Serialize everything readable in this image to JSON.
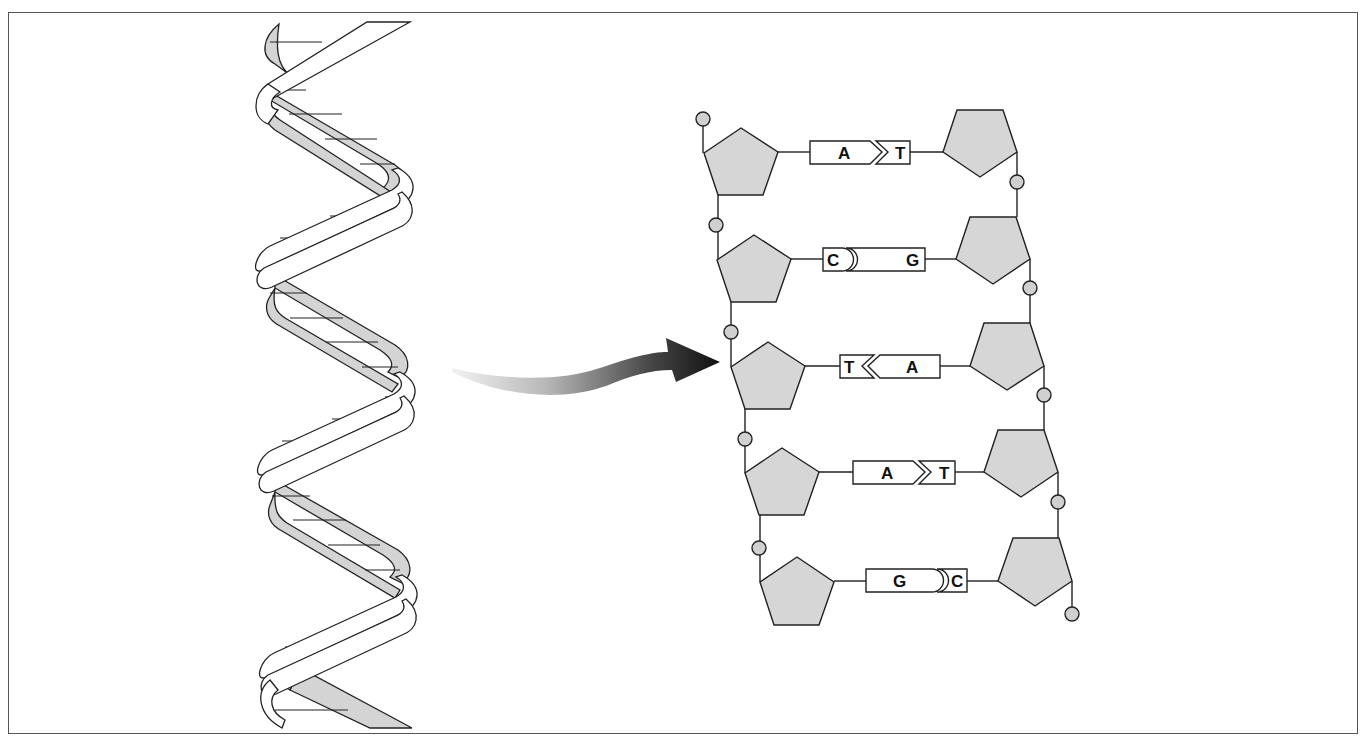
{
  "diagram": {
    "colors": {
      "stroke": "#222222",
      "sugar_fill": "#d6d6d6",
      "phosphate_fill": "#d0d0d0",
      "helix_back_fill": "#d4d4d4",
      "helix_front_fill": "#ffffff",
      "arrow_start": "#e8e8e8",
      "arrow_end": "#111111",
      "background": "#ffffff"
    },
    "helix": {
      "label": "double-helix",
      "turns": 2
    },
    "arrow": {
      "label": "unwinding-arrow"
    },
    "base_pairs": [
      {
        "left": "A",
        "right": "T",
        "left_shape": "arrow",
        "right_shape": "notch"
      },
      {
        "left": "C",
        "right": "G",
        "left_shape": "round",
        "right_shape": "cup"
      },
      {
        "left": "T",
        "right": "A",
        "left_shape": "notch",
        "right_shape": "arrow"
      },
      {
        "left": "A",
        "right": "T",
        "left_shape": "arrow",
        "right_shape": "notch"
      },
      {
        "left": "G",
        "right": "C",
        "left_shape": "round",
        "right_shape": "cup"
      }
    ]
  }
}
